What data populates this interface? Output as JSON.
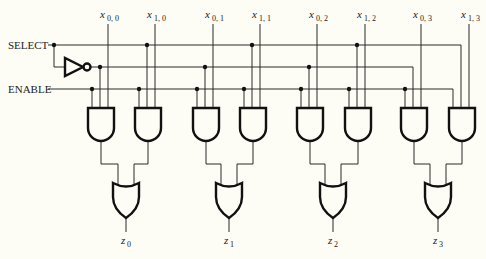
{
  "diagram": {
    "colors": {
      "background": "#fdfcf5",
      "ink": "#111111"
    },
    "signals": {
      "select": {
        "label": "SELECT",
        "y": 45,
        "x_start": 54
      },
      "select_not": {
        "y": 67
      },
      "enable": {
        "label": "ENABLE",
        "y": 89,
        "x_start": 54
      }
    },
    "inverter": {
      "x": 65,
      "y": 67,
      "label": "NOT"
    },
    "inputs": [
      {
        "var": "x",
        "sub": "0, 0",
        "x": 108
      },
      {
        "var": "x",
        "sub": "1, 0",
        "x": 155
      },
      {
        "var": "x",
        "sub": "0, 1",
        "x": 213
      },
      {
        "var": "x",
        "sub": "1, 1",
        "x": 260
      },
      {
        "var": "x",
        "sub": "0, 2",
        "x": 317
      },
      {
        "var": "x",
        "sub": "1, 2",
        "x": 365
      },
      {
        "var": "x",
        "sub": "0, 3",
        "x": 421
      },
      {
        "var": "x",
        "sub": "1, 3",
        "x": 469
      }
    ],
    "and_gates": [
      {
        "x": 88,
        "sel": "not"
      },
      {
        "x": 135,
        "sel": "sel"
      },
      {
        "x": 193,
        "sel": "not"
      },
      {
        "x": 240,
        "sel": "sel"
      },
      {
        "x": 297,
        "sel": "not"
      },
      {
        "x": 345,
        "sel": "sel"
      },
      {
        "x": 401,
        "sel": "not"
      },
      {
        "x": 449,
        "sel": "sel"
      }
    ],
    "or_gates": [
      {
        "x": 113,
        "out_var": "z",
        "out_sub": "0"
      },
      {
        "x": 216,
        "out_var": "z",
        "out_sub": "1"
      },
      {
        "x": 320,
        "out_var": "z",
        "out_sub": "2"
      },
      {
        "x": 425,
        "out_var": "z",
        "out_sub": "3"
      }
    ],
    "outputs": [
      {
        "label": "z0"
      },
      {
        "label": "z1"
      },
      {
        "label": "z2"
      },
      {
        "label": "z3"
      }
    ]
  }
}
